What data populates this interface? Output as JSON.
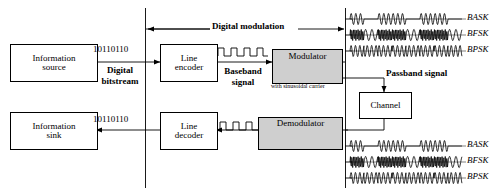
{
  "diagram": {
    "top_label": "Digital modulation",
    "blocks": {
      "info_source": {
        "line1": "Information",
        "line2": "source"
      },
      "line_encoder": {
        "line1": "Line",
        "line2": "encoder"
      },
      "modulator": {
        "label": "Modulator",
        "note": "with sinusoidal carrier"
      },
      "channel": {
        "label": "Channel"
      },
      "demodulator": {
        "label": "Demodulator"
      },
      "line_decoder": {
        "line1": "Line",
        "line2": "decoder"
      },
      "info_sink": {
        "line1": "Information",
        "line2": "sink"
      }
    },
    "signals": {
      "bitstream_top": "10110110",
      "bitstream_bottom": "10110110",
      "digital_bitstream_label_l1": "Digital",
      "digital_bitstream_label_l2": "bitstream",
      "baseband_label_l1": "Baseband",
      "baseband_label_l2": "signal",
      "passband_label": "Passband signal"
    },
    "waveform_labels_top": [
      "BASK",
      "BFSK",
      "BPSK"
    ],
    "waveform_labels_bottom": [
      "BASK",
      "BFSK",
      "BPSK"
    ],
    "colors": {
      "line": "#000000",
      "shaded_block_fill": "#cfcfcf",
      "background": "#ffffff"
    }
  },
  "chart_data": {
    "type": "line",
    "xlabel": "",
    "ylabel": "",
    "grid": false,
    "legend": "right",
    "bit_sequence": [
      1,
      0,
      1,
      1,
      0,
      1,
      1,
      0
    ],
    "series": [
      {
        "name": "BASK",
        "description": "Binary amplitude-shift keying: carrier burst for bit 1, zero amplitude for bit 0",
        "carrier_cycles_per_bit": 3,
        "amplitude_for_one": 1.0,
        "amplitude_for_zero": 0.0,
        "frequency_for_one": 1.0,
        "frequency_for_zero": 1.0
      },
      {
        "name": "BFSK",
        "description": "Binary frequency-shift keying: high frequency for bit 1, low frequency for bit 0",
        "carrier_cycles_per_bit": 3,
        "amplitude_for_one": 1.0,
        "amplitude_for_zero": 1.0,
        "frequency_for_one": 4.0,
        "frequency_for_zero": 1.0
      },
      {
        "name": "BPSK",
        "description": "Binary phase-shift keying: constant amplitude and frequency, 180 degree phase reversal on bit change",
        "carrier_cycles_per_bit": 3,
        "amplitude_for_one": 1.0,
        "amplitude_for_zero": 1.0,
        "frequency_for_one": 1.0,
        "frequency_for_zero": 1.0,
        "phase_for_one_deg": 0,
        "phase_for_zero_deg": 180
      }
    ],
    "baseband": {
      "name": "Baseband signal",
      "description": "Rectangular NRZ pulse train representing the line-encoded bitstream",
      "levels": [
        1,
        0,
        1,
        0,
        1,
        0,
        1,
        0
      ]
    }
  }
}
